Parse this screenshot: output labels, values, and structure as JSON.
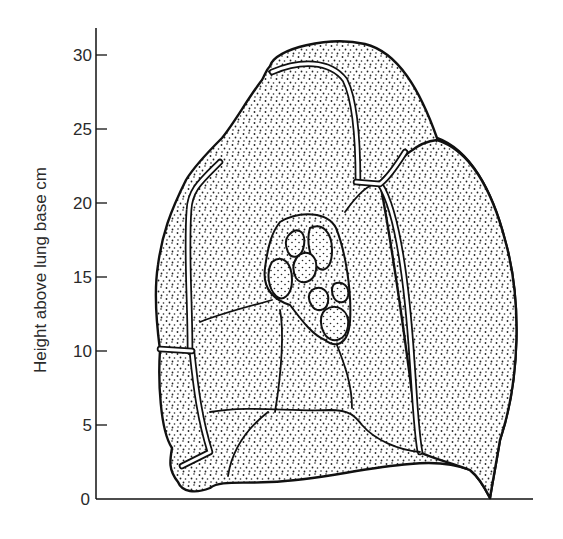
{
  "figure": {
    "type": "diagram",
    "y_axis": {
      "label": "Height above lung base cm",
      "ticks": [
        {
          "value": 0,
          "label": "0"
        },
        {
          "value": 5,
          "label": "5"
        },
        {
          "value": 10,
          "label": "10"
        },
        {
          "value": 15,
          "label": "15"
        },
        {
          "value": 20,
          "label": "20"
        },
        {
          "value": 25,
          "label": "25"
        },
        {
          "value": 30,
          "label": "30"
        }
      ],
      "range": [
        0,
        31
      ]
    },
    "colors": {
      "ink": "#111111",
      "label": "#2a2a2a",
      "background": "#ffffff"
    }
  }
}
